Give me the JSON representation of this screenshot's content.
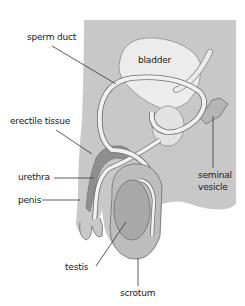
{
  "diagram": {
    "labels": {
      "sperm_duct": "sperm duct",
      "bladder": "bladder",
      "erectile_tissue": "erectile tissue",
      "urethra": "urethra",
      "penis": "penis",
      "seminal_vesicle_line1": "seminal",
      "seminal_vesicle_line2": "vesicle",
      "testis": "testis",
      "scrotum": "scrotum"
    },
    "colors": {
      "body": "#c8c8c8",
      "organ_light": "#ececec",
      "tissue_dark": "#8f8f8f",
      "testis": "#a9a9a9",
      "outline": "#6d6d6d",
      "leader_line": "#333333"
    }
  }
}
